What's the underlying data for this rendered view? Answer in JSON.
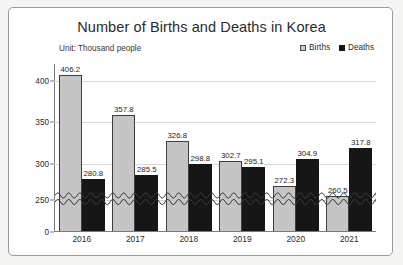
{
  "chart_data": {
    "type": "bar",
    "title": "Number of Births and Deaths in Korea",
    "subtitle": "Unit: Thousand people",
    "xlabel": "",
    "ylabel": "",
    "categories": [
      "2016",
      "2017",
      "2018",
      "2019",
      "2020",
      "2021"
    ],
    "series": [
      {
        "name": "Births",
        "color": "#c5c5c5",
        "values": [
          406.2,
          357.8,
          326.8,
          302.7,
          272.3,
          260.5
        ]
      },
      {
        "name": "Deaths",
        "color": "#161616",
        "values": [
          280.8,
          285.5,
          298.8,
          295.1,
          304.9,
          317.8
        ]
      }
    ],
    "ytick_labels": [
      "400",
      "350",
      "300",
      "250",
      "0"
    ],
    "ytick_values": [
      400,
      350,
      300,
      250,
      0
    ],
    "ylim": [
      0,
      420
    ],
    "axis_break": {
      "present": true,
      "style": "zigzag",
      "between": [
        0,
        250
      ]
    },
    "grid": true,
    "legend_position": "top-right"
  },
  "legend": {
    "items": [
      {
        "label": "Births",
        "swatch": "births-swatch"
      },
      {
        "label": "Deaths",
        "swatch": "deaths-swatch"
      }
    ]
  }
}
